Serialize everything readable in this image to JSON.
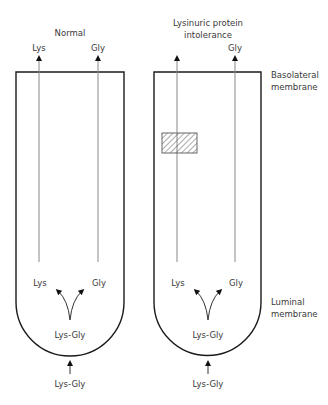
{
  "panels": [
    {
      "title": "Normal",
      "top_labels": {
        "left": "Lys",
        "right": "Gly"
      },
      "inner_labels": {
        "left": "Lys",
        "right": "Gly",
        "dipeptide": "Lys-Gly"
      },
      "outside_label": "Lys-Gly",
      "transport_block": false
    },
    {
      "title_line1": "Lysinuric protein",
      "title_line2": "intolerance",
      "top_labels": {
        "left": "",
        "right": "Gly"
      },
      "inner_labels": {
        "left": "Lys",
        "right": "Gly",
        "dipeptide": "Lys-Gly"
      },
      "outside_label": "Lys-Gly",
      "transport_block": true
    }
  ],
  "side_labels": {
    "basolateral_line1": "Basolateral",
    "basolateral_line2": "membrane",
    "luminal_line1": "Luminal",
    "luminal_line2": "membrane"
  },
  "colors": {
    "outline": "#1a1a1a",
    "line": "#888888",
    "hatch": "#555555"
  }
}
